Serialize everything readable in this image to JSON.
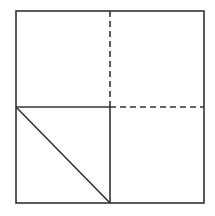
{
  "diagram": {
    "stroke_color": "#333333",
    "background": "#ffffff",
    "outer_square": {
      "x1": 16,
      "y1": 11,
      "x2": 204,
      "y2": 203
    },
    "solid_lines": [
      {
        "name": "horizontal-midline-left",
        "x1": 16,
        "y1": 107,
        "x2": 110,
        "y2": 107
      },
      {
        "name": "vertical-midline-bottom",
        "x1": 110,
        "y1": 107,
        "x2": 110,
        "y2": 203
      },
      {
        "name": "diagonal-bottom-left",
        "x1": 16,
        "y1": 107,
        "x2": 110,
        "y2": 203
      }
    ],
    "dashed_lines": [
      {
        "name": "vertical-midline-top",
        "x1": 110,
        "y1": 11,
        "x2": 110,
        "y2": 107
      },
      {
        "name": "horizontal-midline-right",
        "x1": 110,
        "y1": 107,
        "x2": 204,
        "y2": 107
      }
    ]
  }
}
